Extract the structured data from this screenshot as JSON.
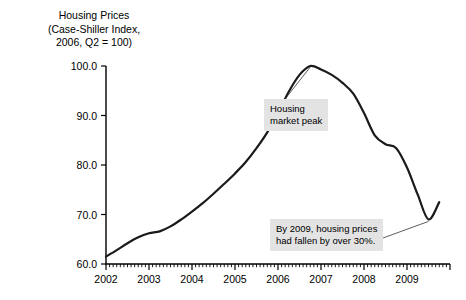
{
  "title": {
    "line1": "Housing Prices",
    "line2": "(Case-Shiller Index,",
    "line3": "2006, Q2 = 100)"
  },
  "annotations": [
    {
      "id": "housing-market-peak",
      "line1": "Housing",
      "line2": "market peak"
    },
    {
      "id": "price-decline",
      "line1": "By 2009, housing prices",
      "line2": "had fallen by over 30%."
    }
  ],
  "chart_data": {
    "type": "line",
    "title": "Housing Prices (Case-Shiller Index, 2006, Q2 = 100)",
    "xlabel": "",
    "ylabel": "Case-Shiller Index (2006, Q2 = 100)",
    "xlim": [
      2002.0,
      2010.0
    ],
    "ylim": [
      60.0,
      100.0
    ],
    "grid": false,
    "legend": false,
    "yticks": [
      60.0,
      70.0,
      80.0,
      90.0,
      100.0
    ],
    "ytick_labels": [
      "60.0",
      "70.0",
      "80.0",
      "90.0",
      "100.0"
    ],
    "xticks": [
      2002,
      2003,
      2004,
      2005,
      2006,
      2007,
      2008,
      2009
    ],
    "xtick_labels": [
      "2002",
      "2003",
      "2004",
      "2005",
      "2006",
      "2007",
      "2008",
      "2009"
    ],
    "minor_ticks_per_year": 12,
    "line_color": "#1a1a1a",
    "series": [
      {
        "name": "Case-Shiller Home Price Index",
        "x": [
          2002.0,
          2002.25,
          2002.5,
          2002.75,
          2003.0,
          2003.25,
          2003.5,
          2003.75,
          2004.0,
          2004.25,
          2004.5,
          2004.75,
          2005.0,
          2005.25,
          2005.5,
          2005.75,
          2006.0,
          2006.25,
          2006.5,
          2006.75,
          2007.0,
          2007.25,
          2007.5,
          2007.75,
          2008.0,
          2008.25,
          2008.5,
          2008.75,
          2009.0,
          2009.25,
          2009.5,
          2009.75
        ],
        "values": [
          61.5,
          62.8,
          64.2,
          65.4,
          66.2,
          66.6,
          67.6,
          69.0,
          70.6,
          72.3,
          74.2,
          76.2,
          78.3,
          80.6,
          83.4,
          86.6,
          90.5,
          94.8,
          98.2,
          100.0,
          99.3,
          98.2,
          96.6,
          94.4,
          90.5,
          86.0,
          84.2,
          83.4,
          79.5,
          74.0,
          69.0,
          72.5
        ]
      }
    ],
    "annotations": [
      {
        "text": "Housing market peak",
        "points_to_x": 2006.75,
        "points_to_y": 100.0
      },
      {
        "text": "By 2009, housing prices had fallen by over 30%.",
        "points_to_x": 2009.5,
        "points_to_y": 69.0
      }
    ]
  }
}
